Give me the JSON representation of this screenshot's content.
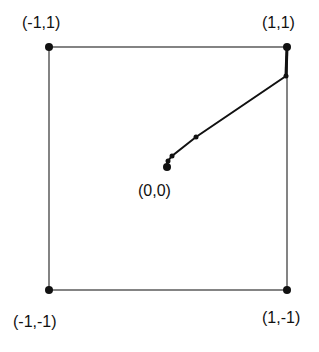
{
  "diagram": {
    "corners": [
      {
        "label": "(-1,1)",
        "x": 49,
        "y": 47
      },
      {
        "label": "(1,1)",
        "x": 287,
        "y": 47
      },
      {
        "label": "(-1,-1)",
        "x": 49,
        "y": 290
      },
      {
        "label": "(1,-1)",
        "x": 287,
        "y": 290
      }
    ],
    "origin": {
      "label": "(0,0)",
      "x": 167,
      "y": 167
    },
    "path_points": [
      {
        "x": 287,
        "y": 47
      },
      {
        "x": 286,
        "y": 76
      },
      {
        "x": 196,
        "y": 137
      },
      {
        "x": 172,
        "y": 156
      },
      {
        "x": 168,
        "y": 161
      },
      {
        "x": 167,
        "y": 167
      }
    ],
    "colors": {
      "line": "#111111",
      "square": "#222222"
    }
  }
}
